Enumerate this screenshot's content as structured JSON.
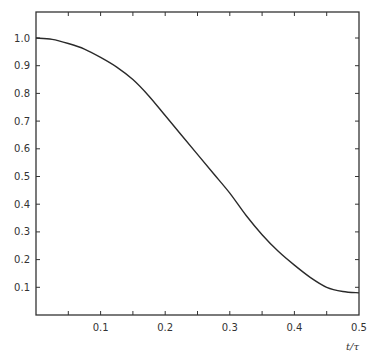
{
  "chart_data": {
    "type": "line",
    "title": "",
    "xlabel": "t/τ",
    "ylabel": "",
    "xlim": [
      0,
      0.5
    ],
    "ylim": [
      0,
      1.09
    ],
    "grid": false,
    "legend": null,
    "x_ticks": [
      "0.1",
      "0.2",
      "0.3",
      "0.4",
      "0.5"
    ],
    "y_ticks": [
      "0.1",
      "0.2",
      "0.3",
      "0.4",
      "0.5",
      "0.6",
      "0.7",
      "0.8",
      "0.9",
      "1.0"
    ],
    "series": [
      {
        "name": "curve",
        "x": [
          0,
          0.025,
          0.05,
          0.075,
          0.1,
          0.125,
          0.15,
          0.175,
          0.2,
          0.225,
          0.25,
          0.275,
          0.3,
          0.325,
          0.35,
          0.375,
          0.4,
          0.425,
          0.45,
          0.475,
          0.5
        ],
        "y": [
          1.0,
          0.995,
          0.98,
          0.96,
          0.93,
          0.895,
          0.85,
          0.79,
          0.72,
          0.65,
          0.58,
          0.51,
          0.44,
          0.36,
          0.29,
          0.23,
          0.18,
          0.135,
          0.1,
          0.085,
          0.08
        ]
      }
    ]
  }
}
